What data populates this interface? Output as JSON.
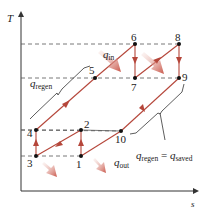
{
  "diagram": {
    "type": "T-s diagram (gas turbine cycle with regeneration, intercooling, reheating)",
    "axes": {
      "y_label": "T",
      "x_label": "s"
    },
    "colors": {
      "process": "#b5463a",
      "dashed": "#555555",
      "axis": "#333333",
      "point": "#111111",
      "heat_arrow": "#c9574a"
    },
    "points": [
      {
        "id": "1",
        "label": "1",
        "x": 81,
        "y": 156
      },
      {
        "id": "2",
        "label": "2",
        "x": 81,
        "y": 130
      },
      {
        "id": "3",
        "label": "3",
        "x": 36,
        "y": 156
      },
      {
        "id": "4",
        "label": "4",
        "x": 36,
        "y": 130
      },
      {
        "id": "5",
        "label": "5",
        "x": 95,
        "y": 78
      },
      {
        "id": "6",
        "label": "6",
        "x": 135,
        "y": 44
      },
      {
        "id": "7",
        "label": "7",
        "x": 135,
        "y": 78
      },
      {
        "id": "8",
        "label": "8",
        "x": 179,
        "y": 44
      },
      {
        "id": "9",
        "label": "9",
        "x": 179,
        "y": 78
      },
      {
        "id": "10",
        "label": "10",
        "x": 121,
        "y": 131
      }
    ],
    "labels": {
      "q_in": {
        "main": "q",
        "sub": "in"
      },
      "q_regen": {
        "main": "q",
        "sub": "regen"
      },
      "q_out": {
        "main": "q",
        "sub": "out"
      },
      "q_regen_eq": {
        "main": "q",
        "sub": "regen",
        "eq": " = ",
        "main2": "q",
        "sub2": "saved"
      }
    }
  }
}
